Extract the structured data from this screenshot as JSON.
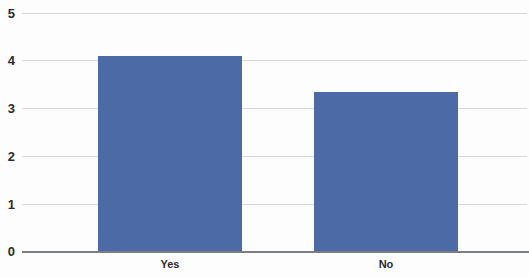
{
  "chart_data": {
    "type": "bar",
    "title": "",
    "subtitle": "",
    "xlabel": "",
    "ylabel": "",
    "categories": [
      "Yes",
      "No"
    ],
    "values": [
      4.1,
      3.35
    ],
    "series": [
      {
        "name": "Response count",
        "values": [
          4.1,
          3.35
        ]
      }
    ],
    "ylim": [
      0,
      5
    ],
    "yticks": [
      0,
      1,
      2,
      3,
      4,
      5
    ],
    "ytick_labels": [
      "0",
      "1",
      "2",
      "3",
      "4",
      "5"
    ],
    "grid": true,
    "grid_axis": "y",
    "legend": false,
    "legend_position": "none",
    "bar_color": "#4c6aa6",
    "gridline_color": "#d3d8dd",
    "axis_color": "#7b7f84",
    "background_color": "#fdfdfd",
    "text_color": "#2c2c2c"
  },
  "axis": {
    "y_ticks": [
      {
        "label": "5",
        "value": 5
      },
      {
        "label": "4",
        "value": 4
      },
      {
        "label": "3",
        "value": 3
      },
      {
        "label": "2",
        "value": 2
      },
      {
        "label": "1",
        "value": 1
      },
      {
        "label": "0",
        "value": 0
      }
    ],
    "x_ticks": [
      {
        "label": "Yes"
      },
      {
        "label": "No"
      }
    ]
  }
}
